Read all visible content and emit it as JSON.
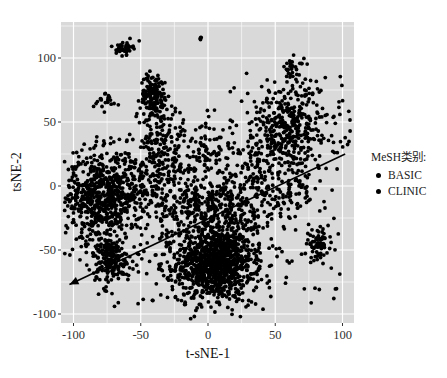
{
  "chart_data": {
    "type": "scatter",
    "title": "",
    "xlabel": "t-sNE-1",
    "ylabel": "tsNE-2",
    "xlim": [
      -108,
      108
    ],
    "ylim": [
      -106,
      128
    ],
    "x_ticks": [
      -100,
      -50,
      0,
      50,
      100
    ],
    "x_tick_labels": [
      "-100",
      "-50",
      "0",
      "50",
      "100"
    ],
    "y_ticks": [
      -100,
      -50,
      0,
      50,
      100
    ],
    "y_tick_labels": [
      "-100",
      "-50",
      "0",
      "50",
      "100"
    ],
    "grid": true,
    "panel_background": "#d9d9d9",
    "gridline_color": "#ffffff",
    "point_color": "#000000",
    "legend": {
      "title": "MeSH类别:",
      "position": "right",
      "entries": [
        {
          "label": "BASIC",
          "color": "#000000"
        },
        {
          "label": "CLINIC",
          "color": "#000000"
        }
      ]
    },
    "annotations": [
      {
        "type": "arrow",
        "from": [
          102,
          25
        ],
        "to": [
          -103,
          -77
        ],
        "head_at": "to"
      }
    ],
    "clusters": [
      {
        "name": "bottom-center-dense",
        "cx": 5,
        "cy": -60,
        "sx": 14,
        "sy": 14,
        "n": 900,
        "category": "CLINIC"
      },
      {
        "name": "bottom-center-halo",
        "cx": 5,
        "cy": -55,
        "sx": 25,
        "sy": 22,
        "n": 260,
        "category": "CLINIC"
      },
      {
        "name": "left-large",
        "cx": -80,
        "cy": -10,
        "sx": 13,
        "sy": 18,
        "n": 520,
        "category": "BASIC"
      },
      {
        "name": "left-spread",
        "cx": -60,
        "cy": 0,
        "sx": 20,
        "sy": 14,
        "n": 260,
        "category": "BASIC"
      },
      {
        "name": "lower-left",
        "cx": -72,
        "cy": -58,
        "sx": 7,
        "sy": 9,
        "n": 180,
        "category": "BASIC"
      },
      {
        "name": "upper-mid-left",
        "cx": -40,
        "cy": 70,
        "sx": 5,
        "sy": 9,
        "n": 160,
        "category": "BASIC"
      },
      {
        "name": "upper-left-small",
        "cx": -62,
        "cy": 108,
        "sx": 3,
        "sy": 2.5,
        "n": 45,
        "category": "BASIC"
      },
      {
        "name": "top-center-dot",
        "cx": -6,
        "cy": 116,
        "sx": 1,
        "sy": 1,
        "n": 4,
        "category": "BASIC"
      },
      {
        "name": "upper-right",
        "cx": 60,
        "cy": 45,
        "sx": 20,
        "sy": 18,
        "n": 420,
        "category": "CLINIC"
      },
      {
        "name": "right-upper-tip",
        "cx": 63,
        "cy": 92,
        "sx": 4,
        "sy": 4,
        "n": 30,
        "category": "CLINIC"
      },
      {
        "name": "right-lower",
        "cx": 82,
        "cy": -45,
        "sx": 4,
        "sy": 5,
        "n": 70,
        "category": "CLINIC"
      },
      {
        "name": "mid-right-band",
        "cx": 40,
        "cy": -5,
        "sx": 22,
        "sy": 16,
        "n": 260,
        "category": "CLINIC"
      },
      {
        "name": "center-band",
        "cx": -5,
        "cy": -15,
        "sx": 18,
        "sy": 10,
        "n": 220,
        "category": "BASIC"
      },
      {
        "name": "mid-left-column",
        "cx": -35,
        "cy": 30,
        "sx": 10,
        "sy": 16,
        "n": 160,
        "category": "BASIC"
      },
      {
        "name": "center-upper",
        "cx": 0,
        "cy": 25,
        "sx": 10,
        "sy": 14,
        "n": 90,
        "category": "BASIC"
      },
      {
        "name": "upper-left-edge",
        "cx": -75,
        "cy": 65,
        "sx": 5,
        "sy": 4,
        "n": 20,
        "category": "BASIC"
      }
    ]
  },
  "plot": {
    "left": 61,
    "top": 22,
    "right": 354,
    "bottom": 323,
    "x0_px": 208,
    "x_scale": 1.345,
    "y0_px": 186,
    "y_scale": 1.28
  }
}
